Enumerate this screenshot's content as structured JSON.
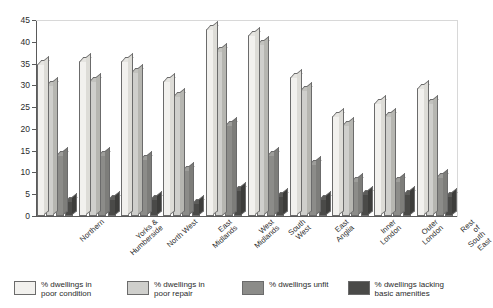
{
  "chart_data": {
    "type": "bar",
    "title": "",
    "subtitle": "",
    "xlabel": "",
    "ylabel": "",
    "ylim": [
      0,
      45
    ],
    "yticks": [
      0,
      5,
      10,
      15,
      20,
      25,
      30,
      35,
      40,
      45
    ],
    "grid": false,
    "legend_position": "bottom",
    "style": "3d-grouped-column",
    "categories": [
      "Northern",
      "Yorks &\nHumberside",
      "North West",
      "East\nMidlands",
      "West\nMidlands",
      "South\nWest",
      "East\nAnglia",
      "Inner\nLondon",
      "Outer\nLondon",
      "Rest of\nSouth East"
    ],
    "series": [
      {
        "name": "% dwellings in\npoor condition",
        "color": "#f2f1ee",
        "values": [
          35,
          35.5,
          35.5,
          31,
          43,
          41.5,
          32,
          23,
          26,
          29.5
        ]
      },
      {
        "name": "% dwellings in\npoor repair",
        "color": "#cfcfcc",
        "values": [
          30,
          31,
          33,
          27.5,
          38,
          39.5,
          29,
          21,
          23,
          26
        ]
      },
      {
        "name": "% dwellings unfit",
        "color": "#8c8c89",
        "values": [
          14,
          14,
          13,
          10.5,
          21,
          14,
          12,
          8,
          8,
          9
        ]
      },
      {
        "name": "% dwellings lacking\nbasic amenities",
        "color": "#4a4a48",
        "values": [
          3.5,
          4,
          4,
          3,
          6,
          4.5,
          4,
          5,
          5,
          4.5
        ]
      }
    ]
  },
  "axis": {
    "y_tick_labels": [
      "0",
      "5",
      "10",
      "15",
      "20",
      "25",
      "30",
      "35",
      "40",
      "45"
    ]
  },
  "legend": {
    "items": [
      {
        "label": "% dwellings in\npoor condition",
        "swatch": "legend-swatch-poor-condition"
      },
      {
        "label": "% dwellings in\npoor repair",
        "swatch": "legend-swatch-poor-repair"
      },
      {
        "label": "% dwellings unfit",
        "swatch": "legend-swatch-unfit"
      },
      {
        "label": "% dwellings lacking\nbasic amenities",
        "swatch": "legend-swatch-lacking-amenities"
      }
    ]
  }
}
